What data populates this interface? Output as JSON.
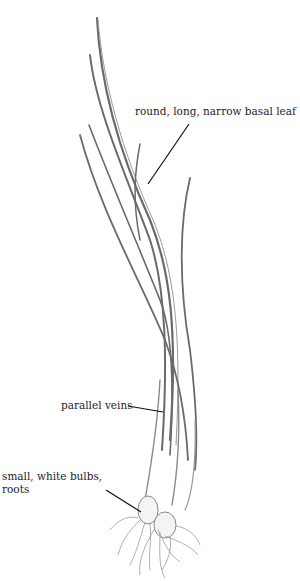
{
  "illustration": {
    "subject": "grass-like plant with basal leaves, bulbs and roots",
    "colors": {
      "background": "#ffffff",
      "leaf_stroke": "#5a5a5a",
      "leaf_fill": "#9a9a9a",
      "leader_line": "#111111",
      "label_text": "#1e1e1e"
    }
  },
  "labels": [
    {
      "id": "leaf",
      "lines": [
        "round, long, narrow basal leaf"
      ]
    },
    {
      "id": "veins",
      "lines": [
        "parallel veins"
      ]
    },
    {
      "id": "bulbs",
      "lines": [
        "small, white bulbs,",
        "roots"
      ]
    }
  ]
}
